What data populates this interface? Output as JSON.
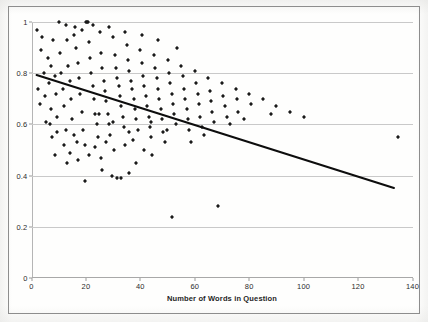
{
  "figure": {
    "background_color": "#fefefd",
    "frame_color": "#8d8d8d",
    "marker_color": "#1a1a1a",
    "trend_color": "#0d0d0d",
    "grid_color": "#c9c9c9"
  },
  "axes": {
    "x_ticks": [
      "0",
      "20",
      "40",
      "60",
      "80",
      "100",
      "120",
      "140"
    ],
    "y_ticks": [
      "0",
      "0.2",
      "0.4",
      "0.6",
      "0.8",
      "1"
    ],
    "x_label": "Number of Words in Question",
    "y_label": ""
  },
  "chart_data": {
    "type": "scatter",
    "title": "",
    "xlabel": "Number of Words in Question",
    "ylabel": "",
    "xlim": [
      0,
      140
    ],
    "ylim": [
      0,
      1
    ],
    "xticks": [
      0,
      20,
      40,
      60,
      80,
      100,
      120,
      140
    ],
    "yticks": [
      0,
      0.2,
      0.4,
      0.6,
      0.8,
      1
    ],
    "grid": "horizontal",
    "legend": "none",
    "marker": "diamond",
    "series": [
      {
        "name": "observations",
        "points": [
          [
            2.0,
            0.97
          ],
          [
            3.5,
            0.89
          ],
          [
            4.5,
            0.8
          ],
          [
            5.0,
            0.71
          ],
          [
            5.5,
            0.61
          ],
          [
            6.0,
            0.86
          ],
          [
            6.5,
            0.76
          ],
          [
            7.0,
            0.66
          ],
          [
            7.5,
            0.55
          ],
          [
            8.0,
            0.93
          ],
          [
            8.5,
            0.79
          ],
          [
            9.0,
            0.72
          ],
          [
            9.5,
            0.63
          ],
          [
            10.0,
            1.0
          ],
          [
            10.5,
            0.88
          ],
          [
            11.0,
            0.8
          ],
          [
            11.5,
            0.74
          ],
          [
            12.0,
            0.67
          ],
          [
            12.5,
            0.58
          ],
          [
            13.0,
            0.93
          ],
          [
            13.5,
            0.83
          ],
          [
            14.0,
            0.77
          ],
          [
            14.5,
            0.7
          ],
          [
            15.0,
            0.62
          ],
          [
            15.5,
            0.56
          ],
          [
            16.0,
            0.98
          ],
          [
            16.5,
            0.9
          ],
          [
            17.0,
            0.84
          ],
          [
            17.5,
            0.78
          ],
          [
            18.0,
            0.72
          ],
          [
            18.5,
            0.65
          ],
          [
            19.0,
            0.58
          ],
          [
            19.5,
            0.52
          ],
          [
            20.0,
            1.0
          ],
          [
            20.3,
            1.0
          ],
          [
            20.8,
            1.0
          ],
          [
            21.0,
            0.92
          ],
          [
            21.5,
            0.86
          ],
          [
            22.0,
            0.8
          ],
          [
            22.5,
            0.75
          ],
          [
            23.0,
            0.7
          ],
          [
            23.5,
            0.64
          ],
          [
            24.0,
            0.6
          ],
          [
            24.5,
            0.55
          ],
          [
            19.8,
            0.38
          ],
          [
            25.0,
            0.96
          ],
          [
            25.5,
            0.88
          ],
          [
            26.0,
            0.82
          ],
          [
            26.5,
            0.77
          ],
          [
            27.0,
            0.73
          ],
          [
            27.5,
            0.69
          ],
          [
            28.0,
            0.64
          ],
          [
            28.5,
            0.6
          ],
          [
            29.0,
            0.56
          ],
          [
            25.5,
            0.47
          ],
          [
            26.0,
            0.42
          ],
          [
            30.0,
            0.94
          ],
          [
            30.5,
            0.87
          ],
          [
            31.0,
            0.82
          ],
          [
            31.5,
            0.78
          ],
          [
            32.0,
            0.75
          ],
          [
            32.5,
            0.71
          ],
          [
            33.0,
            0.67
          ],
          [
            33.5,
            0.63
          ],
          [
            34.0,
            0.59
          ],
          [
            29.5,
            0.4
          ],
          [
            31.5,
            0.39
          ],
          [
            33.0,
            0.39
          ],
          [
            35.0,
            0.91
          ],
          [
            35.5,
            0.85
          ],
          [
            36.0,
            0.81
          ],
          [
            36.5,
            0.77
          ],
          [
            37.0,
            0.74
          ],
          [
            37.5,
            0.7
          ],
          [
            38.0,
            0.66
          ],
          [
            38.5,
            0.62
          ],
          [
            39.0,
            0.58
          ],
          [
            36.0,
            0.41
          ],
          [
            38.5,
            0.45
          ],
          [
            40.0,
            0.89
          ],
          [
            40.5,
            0.84
          ],
          [
            41.0,
            0.79
          ],
          [
            41.5,
            0.75
          ],
          [
            42.0,
            0.71
          ],
          [
            42.5,
            0.67
          ],
          [
            43.0,
            0.63
          ],
          [
            43.5,
            0.59
          ],
          [
            44.0,
            0.55
          ],
          [
            45.0,
            0.87
          ],
          [
            45.5,
            0.82
          ],
          [
            46.0,
            0.78
          ],
          [
            46.5,
            0.74
          ],
          [
            47.0,
            0.7
          ],
          [
            47.5,
            0.66
          ],
          [
            48.0,
            0.62
          ],
          [
            48.5,
            0.57
          ],
          [
            49.0,
            0.53
          ],
          [
            50.0,
            0.85
          ],
          [
            50.5,
            0.8
          ],
          [
            51.0,
            0.76
          ],
          [
            51.5,
            0.72
          ],
          [
            52.0,
            0.68
          ],
          [
            52.5,
            0.64
          ],
          [
            53.0,
            0.6
          ],
          [
            51.5,
            0.24
          ],
          [
            55.0,
            0.83
          ],
          [
            55.5,
            0.79
          ],
          [
            56.0,
            0.74
          ],
          [
            56.5,
            0.7
          ],
          [
            57.0,
            0.66
          ],
          [
            57.5,
            0.62
          ],
          [
            58.0,
            0.58
          ],
          [
            60.0,
            0.81
          ],
          [
            60.5,
            0.76
          ],
          [
            61.0,
            0.72
          ],
          [
            61.5,
            0.68
          ],
          [
            62.0,
            0.63
          ],
          [
            62.5,
            0.59
          ],
          [
            65.0,
            0.78
          ],
          [
            65.5,
            0.73
          ],
          [
            66.0,
            0.69
          ],
          [
            66.5,
            0.65
          ],
          [
            67.0,
            0.61
          ],
          [
            68.5,
            0.28
          ],
          [
            70.0,
            0.76
          ],
          [
            70.5,
            0.71
          ],
          [
            71.0,
            0.67
          ],
          [
            72.0,
            0.63
          ],
          [
            75.0,
            0.74
          ],
          [
            75.5,
            0.7
          ],
          [
            76.0,
            0.65
          ],
          [
            80.0,
            0.72
          ],
          [
            80.5,
            0.68
          ],
          [
            85.0,
            0.7
          ],
          [
            90.0,
            0.67
          ],
          [
            95.0,
            0.65
          ],
          [
            100.0,
            0.63
          ],
          [
            134.5,
            0.55
          ],
          [
            4.0,
            0.94
          ],
          [
            7.2,
            0.83
          ],
          [
            9.2,
            0.57
          ],
          [
            11.8,
            0.52
          ],
          [
            14.2,
            0.49
          ],
          [
            17.2,
            0.46
          ],
          [
            21.2,
            0.48
          ],
          [
            23.2,
            0.51
          ],
          [
            27.2,
            0.53
          ],
          [
            30.2,
            0.5
          ],
          [
            34.2,
            0.52
          ],
          [
            37.2,
            0.54
          ],
          [
            41.2,
            0.5
          ],
          [
            44.2,
            0.48
          ],
          [
            12.5,
            0.99
          ],
          [
            15.5,
            0.95
          ],
          [
            18.5,
            0.97
          ],
          [
            22.5,
            0.99
          ],
          [
            28.5,
            0.98
          ],
          [
            34.5,
            0.96
          ],
          [
            40.5,
            0.95
          ],
          [
            46.5,
            0.93
          ],
          [
            53.5,
            0.9
          ],
          [
            2.5,
            0.74
          ],
          [
            3.0,
            0.68
          ],
          [
            6.8,
            0.6
          ],
          [
            8.8,
            0.48
          ],
          [
            13.2,
            0.45
          ],
          [
            16.8,
            0.53
          ],
          [
            24.8,
            0.64
          ],
          [
            29.8,
            0.61
          ],
          [
            35.8,
            0.57
          ],
          [
            43.8,
            0.61
          ],
          [
            49.8,
            0.58
          ],
          [
            58.5,
            0.53
          ],
          [
            63.5,
            0.56
          ],
          [
            73.0,
            0.6
          ],
          [
            78.0,
            0.62
          ],
          [
            88.0,
            0.64
          ]
        ]
      }
    ],
    "trendline": {
      "type": "linear",
      "x_start": 1.7,
      "y_start": 0.793,
      "x_end": 133.0,
      "y_end": 0.352,
      "slope": -0.00336,
      "intercept": 0.799
    }
  }
}
